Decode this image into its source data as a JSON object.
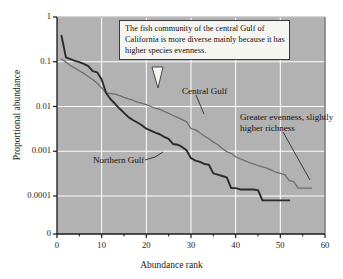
{
  "chart_data": {
    "type": "line",
    "title": "",
    "xlabel": "Abundance rank",
    "ylabel": "Proportional abundance",
    "xlim": [
      0,
      60
    ],
    "xticks": [
      0,
      10,
      20,
      30,
      40,
      50,
      60
    ],
    "xticklabels": [
      "0",
      "10",
      "20",
      "30",
      "40",
      "50",
      "60"
    ],
    "xminorticks": [
      5,
      15,
      25,
      35,
      45,
      55
    ],
    "yscale": "log",
    "yticks": [
      1,
      0.1,
      0.01,
      0.001,
      0.0001
    ],
    "yticklabels": [
      "1",
      "0.1",
      "0.01",
      "0.001",
      "0.0001"
    ],
    "y_zero_label": "0",
    "grid": true,
    "grid_color": "#ffffff",
    "plot_background": "#b2b2b2",
    "legend_position": "inline-annotations",
    "series": [
      {
        "name": "Central Gulf",
        "color": "#6e6e6e",
        "line_width": 1.3,
        "x": [
          1,
          2,
          3,
          4,
          5,
          6,
          7,
          8,
          9,
          10,
          11,
          12,
          13,
          14,
          15,
          16,
          17,
          18,
          19,
          20,
          21,
          22,
          23,
          24,
          25,
          26,
          27,
          28,
          29,
          30,
          31,
          32,
          33,
          34,
          35,
          36,
          37,
          38,
          39,
          40,
          41,
          42,
          43,
          44,
          45,
          46,
          47,
          48,
          49,
          50,
          51,
          52,
          53,
          54,
          55,
          56,
          57
        ],
        "y": [
          0.115,
          0.098,
          0.082,
          0.072,
          0.063,
          0.055,
          0.047,
          0.04,
          0.033,
          0.026,
          0.02,
          0.0195,
          0.019,
          0.0175,
          0.016,
          0.0148,
          0.0138,
          0.0125,
          0.0118,
          0.011,
          0.01,
          0.0092,
          0.0086,
          0.0078,
          0.007,
          0.0063,
          0.0057,
          0.0051,
          0.0046,
          0.0032,
          0.003,
          0.0026,
          0.0022,
          0.0019,
          0.0016,
          0.0014,
          0.00115,
          0.00098,
          0.0009,
          0.00075,
          0.00068,
          0.00062,
          0.00056,
          0.00052,
          0.00048,
          0.00045,
          0.00042,
          0.00038,
          0.00034,
          0.00032,
          0.0003,
          0.00022,
          0.00021,
          0.00015,
          0.00015,
          0.00015,
          0.00015
        ]
      },
      {
        "name": "Northern Gulf",
        "color": "#2b2b2b",
        "line_width": 1.9,
        "x": [
          1,
          2,
          3,
          4,
          5,
          6,
          7,
          8,
          9,
          10,
          11,
          12,
          13,
          14,
          15,
          16,
          17,
          18,
          19,
          20,
          21,
          22,
          23,
          24,
          25,
          26,
          27,
          28,
          29,
          30,
          31,
          32,
          33,
          34,
          35,
          36,
          37,
          38,
          39,
          40,
          41,
          42,
          43,
          44,
          45,
          46,
          47,
          48,
          49,
          50,
          51,
          52
        ],
        "y": [
          0.38,
          0.125,
          0.115,
          0.105,
          0.098,
          0.09,
          0.08,
          0.062,
          0.058,
          0.04,
          0.02,
          0.0145,
          0.0115,
          0.009,
          0.0072,
          0.0058,
          0.005,
          0.0044,
          0.0038,
          0.0032,
          0.0029,
          0.0026,
          0.0024,
          0.0021,
          0.0019,
          0.00145,
          0.0014,
          0.00125,
          0.00105,
          0.0007,
          0.00062,
          0.00058,
          0.00052,
          0.0005,
          0.00032,
          0.0003,
          0.00028,
          0.00026,
          0.00015,
          0.00015,
          0.00014,
          0.00014,
          0.00014,
          0.00014,
          0.000135,
          8e-05,
          8e-05,
          8e-05,
          8e-05,
          8e-05,
          8e-05,
          8e-05
        ]
      }
    ],
    "annotations": [
      {
        "id": "callout-box",
        "text": "The fish community of the central Gulf of California is more diverse mainly because it has higher species evenness.",
        "type": "boxed-callout",
        "points_to_series": "Central Gulf",
        "points_to_rank": 21
      },
      {
        "id": "central-gulf-label",
        "text": "Central Gulf",
        "type": "leader-label",
        "points_to_series": "Central Gulf",
        "points_to_rank": 30
      },
      {
        "id": "northern-gulf-label",
        "text": "Northern Gulf",
        "type": "leader-label",
        "points_to_series": "Northern Gulf",
        "points_to_rank": 27
      },
      {
        "id": "richness-label",
        "text": "Greater evenness, slightly higher richness",
        "type": "leader-label",
        "points_to_series": "Central Gulf",
        "points_to_rank": 56
      }
    ]
  },
  "labels": {
    "xlabel": "Abundance rank",
    "ylabel": "Proportional abundance",
    "callout_text": "The fish community of the central Gulf of California is more diverse mainly because it has higher species evenness.",
    "central_gulf": "Central Gulf",
    "northern_gulf": "Northern Gulf",
    "richness_note": "Greater evenness, slightly higher richness"
  }
}
